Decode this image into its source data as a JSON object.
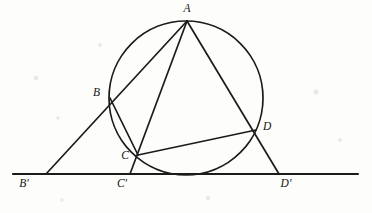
{
  "figure": {
    "kind": "euclidean-geometry-diagram",
    "background_color": "#fdfdfc",
    "ink_color": "#1c1b1a",
    "caption": "Figure 2.1",
    "caption_visible": false
  },
  "circle": {
    "name": "circumscribed-circle",
    "center_x": 186,
    "center_y": 98,
    "radius": 77,
    "stroke_width": 1.7
  },
  "baseline": {
    "name": "tangent-baseline",
    "y": 174,
    "x_start": 13,
    "x_end": 358,
    "stroke_width": 2.1
  },
  "points": [
    {
      "id": "A",
      "label": "A",
      "x": 187,
      "y": 21,
      "label_x": 187,
      "label_y": 12,
      "anchor": "middle",
      "on_circle": true
    },
    {
      "id": "B",
      "label": "B",
      "x": 110,
      "y": 98,
      "label_x": 100,
      "label_y": 96,
      "anchor": "end",
      "on_circle": true
    },
    {
      "id": "C",
      "label": "C",
      "x": 138,
      "y": 155,
      "label_x": 129,
      "label_y": 159,
      "anchor": "end",
      "on_circle": true
    },
    {
      "id": "D",
      "label": "D",
      "x": 256,
      "y": 130,
      "label_x": 263,
      "label_y": 130,
      "anchor": "start",
      "on_circle": true
    },
    {
      "id": "Bp",
      "label": "B'",
      "x": 46,
      "y": 174,
      "label_x": 24,
      "label_y": 187,
      "anchor": "middle",
      "on_circle": false
    },
    {
      "id": "Cp",
      "label": "C'",
      "x": 130,
      "y": 174,
      "label_x": 122,
      "label_y": 187,
      "anchor": "middle",
      "on_circle": false
    },
    {
      "id": "Dp",
      "label": "D'",
      "x": 279,
      "y": 174,
      "label_x": 286,
      "label_y": 187,
      "anchor": "middle",
      "on_circle": false
    }
  ],
  "rays": [
    {
      "name": "ray-A-B-Bprime",
      "from": "A",
      "through": "B",
      "to": "Bp",
      "x1": 187,
      "y1": 21,
      "x2": 46,
      "y2": 174
    },
    {
      "name": "ray-A-C-Cprime",
      "from": "A",
      "through": "C",
      "to": "Cp",
      "x1": 187,
      "y1": 21,
      "x2": 130,
      "y2": 174
    },
    {
      "name": "ray-A-D-Dprime",
      "from": "A",
      "through": "D",
      "to": "Dp",
      "x1": 187,
      "y1": 21,
      "x2": 279,
      "y2": 174
    }
  ],
  "chords": [
    {
      "name": "chord-B-C",
      "from": "B",
      "to": "C",
      "x1": 110,
      "y1": 98,
      "x2": 138,
      "y2": 155
    },
    {
      "name": "chord-C-D",
      "from": "C",
      "to": "D",
      "x1": 138,
      "y1": 155,
      "x2": 256,
      "y2": 130
    }
  ]
}
